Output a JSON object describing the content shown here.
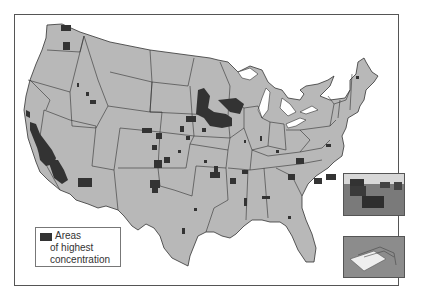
{
  "map": {
    "title": "",
    "subject": "United States map showing areas of highest concentration",
    "colors": {
      "land": "#b8b8b8",
      "water": "#ffffff",
      "border": "#333333",
      "concentration": "#333333",
      "lakes": "#d9d9d9"
    }
  },
  "legend": {
    "line1": "Areas",
    "line2": "of highest",
    "line3": "concentration",
    "swatch_color": "#333333"
  },
  "insets": [
    {
      "name": "cattle-photo",
      "description": "cattle grazing in field"
    },
    {
      "name": "feedlot-illustration",
      "description": "illustration of animal feeding trough"
    }
  ]
}
